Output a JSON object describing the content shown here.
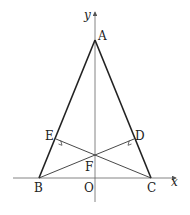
{
  "diagram": {
    "type": "geometry",
    "axes": {
      "x_label": "x",
      "y_label": "y",
      "origin_label": "O"
    },
    "points": {
      "A": {
        "label": "A",
        "x": 95,
        "y": 40
      },
      "B": {
        "label": "B",
        "x": 39,
        "y": 178
      },
      "C": {
        "label": "C",
        "x": 151,
        "y": 178
      },
      "D": {
        "label": "D",
        "x": 134,
        "y": 139
      },
      "E": {
        "label": "E",
        "x": 56,
        "y": 139
      },
      "F": {
        "label": "F",
        "x": 95,
        "y": 154
      },
      "O": {
        "label": "O",
        "x": 95,
        "y": 178
      }
    },
    "segments": [
      "AB",
      "AC",
      "BD",
      "CE"
    ],
    "right_angles": [
      "E",
      "D"
    ],
    "colors": {
      "stroke": "#333333",
      "axis": "#555555"
    }
  }
}
